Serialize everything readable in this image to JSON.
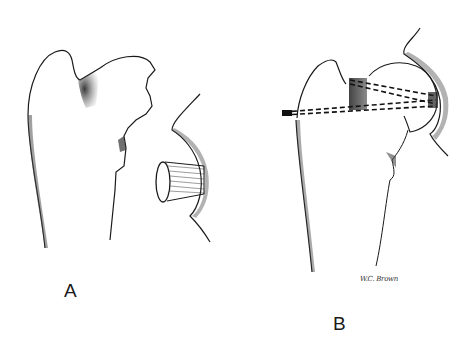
{
  "figure": {
    "panels": [
      {
        "id": "A",
        "label": "A",
        "description": "Proximal humerus with defect in humeral head; separate glenoid with graft bone plug"
      },
      {
        "id": "B",
        "label": "B",
        "description": "Proximal humerus with bone graft fixed by screws (dashed lines) through humeral head into glenoid"
      }
    ],
    "signature": "W.C. Brown",
    "colors": {
      "line": "#1a1a1a",
      "shading": "#555555",
      "background": "#ffffff"
    }
  }
}
